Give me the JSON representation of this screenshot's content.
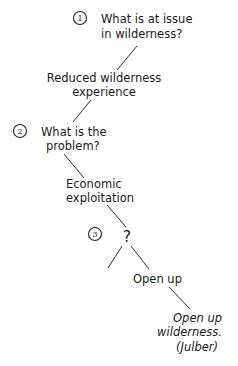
{
  "diagram": {
    "steps": [
      {
        "number": "1",
        "question_lines": [
          "What is at issue",
          "in wilderness?"
        ]
      },
      {
        "number": "2",
        "question_lines": [
          "What is the",
          "problem?"
        ]
      },
      {
        "number": "3",
        "question_lines": [
          "?"
        ]
      }
    ],
    "nodes": {
      "answer1_lines": [
        "Reduced wilderness",
        "experience"
      ],
      "answer2_lines": [
        "Economic",
        "exploitation"
      ],
      "branch_right": "Open up",
      "conclusion_lines": [
        "Open up",
        "wilderness.",
        "(Julber)"
      ]
    }
  }
}
